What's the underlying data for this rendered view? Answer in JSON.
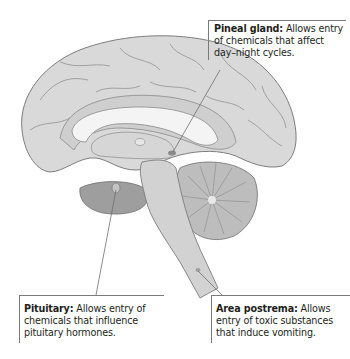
{
  "figure": {
    "colors": {
      "cortex_fill": "#d9d9d9",
      "cortex_stroke": "#7d7d7d",
      "corpus_callosum": "#f4f4f4",
      "brainstem": "#d2d2d2",
      "cerebellum": "#bdbdbd",
      "temporal_lobe": "#9e9e9e",
      "leader_line": "#6e6e6e"
    }
  },
  "callouts": {
    "pineal": {
      "term": "Pineal gland:",
      "description": " Allows entry of chemicals that affect day–night cycles."
    },
    "pituitary": {
      "term": "Pituitary:",
      "description": " Allows entry of chemicals that influence pituitary hormones."
    },
    "area_postrema": {
      "term": "Area postrema:",
      "description": " Allows entry of toxic substances that induce vomiting."
    }
  }
}
